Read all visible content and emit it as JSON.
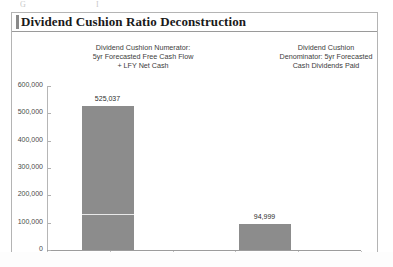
{
  "panel": {
    "title": "Dividend Cushion Ratio Deconstruction"
  },
  "captions": {
    "left": [
      "Dividend Cushion Numerator:",
      "5yr Forecasted Free Cash Flow",
      "+ LFY Net Cash"
    ],
    "right": [
      "Dividend Cushion",
      "Denominator: 5yr Forecasted",
      "Cash Dividends Paid"
    ]
  },
  "artifacts": [
    {
      "text": "G",
      "left": 20,
      "top": 0
    },
    {
      "text": "I",
      "left": 96,
      "top": 0
    }
  ],
  "colors": {
    "bar_fill": "#8c8c8c",
    "panel_border": "#b4b4b4",
    "axis": "#9c9c9c",
    "title_text": "#1a1a1a"
  },
  "chart_data": {
    "type": "bar",
    "title": "Dividend Cushion Ratio Deconstruction",
    "xlabel": "",
    "ylabel": "",
    "ylim": [
      0,
      600000
    ],
    "ytick_values": [
      0,
      100000,
      200000,
      300000,
      400000,
      500000,
      600000
    ],
    "ytick_labels": [
      "0",
      "100,000",
      "200,000",
      "300,000",
      "400,000",
      "500,000",
      "600,000"
    ],
    "grid": false,
    "legend": "none",
    "categories": [
      "Dividend Cushion Numerator: 5yr Forecasted Free Cash Flow + LFY Net Cash",
      "Dividend Cushion Denominator: 5yr Forecasted Cash Dividends Paid"
    ],
    "values": [
      525037,
      94999
    ],
    "value_labels": [
      "525,037",
      "94,999"
    ],
    "annotations": [
      {
        "type": "segment-divider",
        "series_index": 0,
        "value": 132000,
        "note": "thin light rule splitting the numerator bar into two stacked segments"
      }
    ]
  }
}
